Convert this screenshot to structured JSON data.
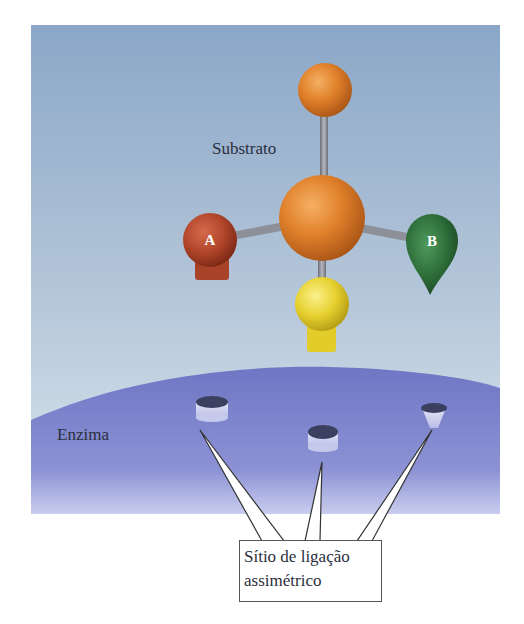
{
  "figure": {
    "substrate_label": "Substrato",
    "enzyme_label": "Enzima",
    "atom_labels": {
      "a": "A",
      "b": "B"
    },
    "callout": {
      "line1": "Sítio de ligação",
      "line2": "assimétrico"
    },
    "colors": {
      "sky_top": "#8ea9c9",
      "sky_bottom": "#d6e0ea",
      "enzyme": "#7279c6",
      "enzyme_light": "#b9bde8",
      "center_atom": "#e0802a",
      "top_atom": "#e08a2e",
      "atom_a": "#b0452a",
      "atom_b": "#2e6e3a",
      "atom_yellow": "#e6d02e",
      "bond": "#8d9099",
      "site": "#3c4060"
    }
  }
}
